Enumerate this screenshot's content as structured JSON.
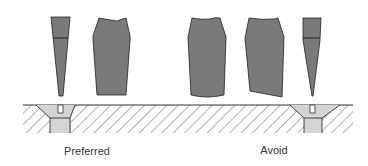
{
  "labels": {
    "preferred": "Preferred",
    "avoid": "Avoid"
  },
  "colors": {
    "tool_fill": "#7a7a7a",
    "tool_stroke": "#222222",
    "plate_hatch": "#555555",
    "hole_fill": "#d4d4d4",
    "background": "#ffffff",
    "text": "#333333"
  },
  "groups": [
    {
      "name": "preferred",
      "tools": [
        "narrow-tapered-point-tool",
        "wide-flat-tool"
      ],
      "hole": "countersunk-hole-left"
    },
    {
      "name": "avoid",
      "tools": [
        "wide-rounded-bottom-tool",
        "wide-slanted-bottom-tool",
        "narrow-sharp-point-tool"
      ],
      "hole": "countersunk-hole-right"
    }
  ]
}
